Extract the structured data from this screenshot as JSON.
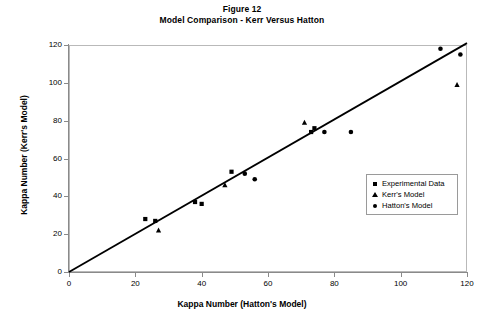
{
  "figure": {
    "title_line1": "Figure 12",
    "title_line2": "Model Comparison - Kerr Versus Hatton"
  },
  "axes": {
    "x_title": "Kappa Number (Hatton's Model)",
    "y_title": "Kappa Number (Kerr's Model)",
    "x_ticks": [
      "0",
      "20",
      "40",
      "60",
      "80",
      "100",
      "120"
    ],
    "y_ticks": [
      "0",
      "20",
      "40",
      "60",
      "80",
      "100",
      "120"
    ]
  },
  "legend": {
    "items": [
      {
        "label": "Experimental Data",
        "marker": "square-marker-icon"
      },
      {
        "label": "Kerr's Model",
        "marker": "triangle-marker-icon"
      },
      {
        "label": "Hatton's Model",
        "marker": "circle-marker-icon"
      }
    ]
  },
  "chart_data": {
    "type": "scatter",
    "xlabel": "Kappa Number (Hatton's Model)",
    "ylabel": "Kappa Number (Kerr's Model)",
    "xlim": [
      0,
      120
    ],
    "ylim": [
      0,
      120
    ],
    "xticks": [
      0,
      20,
      40,
      60,
      80,
      100,
      120
    ],
    "yticks": [
      0,
      20,
      40,
      60,
      80,
      100,
      120
    ],
    "grid": false,
    "legend_position": "lower-right-inside",
    "reference_line": {
      "name": "parity-line",
      "x": [
        0,
        120
      ],
      "y": [
        0,
        121
      ],
      "color": "#000000"
    },
    "series": [
      {
        "name": "Experimental Data",
        "marker": "square",
        "color": "#000000",
        "points": [
          {
            "x": 23,
            "y": 28
          },
          {
            "x": 26,
            "y": 27
          },
          {
            "x": 38,
            "y": 37
          },
          {
            "x": 40,
            "y": 36
          },
          {
            "x": 49,
            "y": 53
          },
          {
            "x": 73,
            "y": 74
          },
          {
            "x": 74,
            "y": 76
          }
        ]
      },
      {
        "name": "Kerr's Model",
        "marker": "triangle",
        "color": "#000000",
        "points": [
          {
            "x": 27,
            "y": 22
          },
          {
            "x": 47,
            "y": 46
          },
          {
            "x": 71,
            "y": 79
          },
          {
            "x": 117,
            "y": 99
          }
        ]
      },
      {
        "name": "Hatton's Model",
        "marker": "circle",
        "color": "#000000",
        "points": [
          {
            "x": 53,
            "y": 52
          },
          {
            "x": 56,
            "y": 49
          },
          {
            "x": 77,
            "y": 74
          },
          {
            "x": 85,
            "y": 74
          },
          {
            "x": 112,
            "y": 118
          },
          {
            "x": 118,
            "y": 115
          }
        ]
      }
    ]
  }
}
